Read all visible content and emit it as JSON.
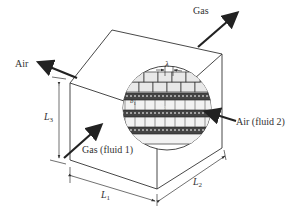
{
  "diagram": {
    "type": "heat-exchanger-core-schematic",
    "labels": {
      "gas_out": "Gas",
      "air_out": "Air",
      "gas_in": "Gas (fluid 1)",
      "air_in": "Air (fluid 2)",
      "dim_L1": "L",
      "dim_L1_sub": "1",
      "dim_L2": "L",
      "dim_L2_sub": "2",
      "dim_L3": "L",
      "dim_L3_sub": "3",
      "lambda": "λ",
      "b1": "b",
      "b1_sub": "1",
      "b2": "b",
      "b2_sub": "2"
    },
    "colors": {
      "line": "#333333",
      "arrow": "#222222",
      "background": "#ffffff"
    }
  }
}
